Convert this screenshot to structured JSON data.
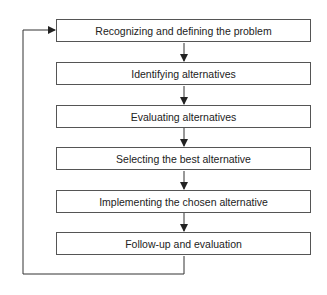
{
  "diagram": {
    "type": "flowchart",
    "steps": [
      {
        "label": "Recognizing and defining the problem"
      },
      {
        "label": "Identifying alternatives"
      },
      {
        "label": "Evaluating alternatives"
      },
      {
        "label": "Selecting the best alternative"
      },
      {
        "label": "Implementing the chosen alternative"
      },
      {
        "label": "Follow-up and evaluation"
      }
    ],
    "feedback_loop": {
      "from": "Follow-up and evaluation",
      "to": "Recognizing and defining the problem"
    },
    "colors": {
      "line": "#333333",
      "border": "#555555",
      "text": "#222222",
      "background": "#ffffff"
    }
  }
}
